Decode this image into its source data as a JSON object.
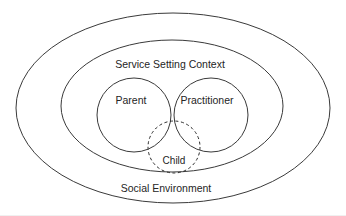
{
  "diagram": {
    "type": "nested-venn",
    "background_color": "#ffffff",
    "stroke_color": "#3a3a3a",
    "text_color": "#252525",
    "rings": [
      {
        "id": "social-environment",
        "label": "Social Environment",
        "style": "solid",
        "shape": "ellipse",
        "cx": 173,
        "cy": 108,
        "rx": 157,
        "ry": 95,
        "label_x": 166,
        "label_y": 189
      },
      {
        "id": "service-setting-context",
        "label": "Service Setting Context",
        "style": "solid",
        "shape": "ellipse",
        "cx": 172,
        "cy": 106,
        "rx": 111,
        "ry": 66,
        "label_x": 170,
        "label_y": 65
      }
    ],
    "lobes": [
      {
        "id": "parent",
        "label": "Parent",
        "style": "solid",
        "shape": "circle",
        "cx": 134,
        "cy": 115,
        "r": 37,
        "label_x": 131,
        "label_y": 101
      },
      {
        "id": "practitioner",
        "label": "Practitioner",
        "style": "solid",
        "shape": "circle",
        "cx": 211,
        "cy": 115,
        "r": 37,
        "label_x": 207,
        "label_y": 101
      }
    ],
    "focus": {
      "id": "child",
      "label": "Child",
      "style": "dashed",
      "shape": "circle",
      "cx": 174,
      "cy": 147,
      "r": 26,
      "label_x": 174,
      "label_y": 161
    }
  }
}
